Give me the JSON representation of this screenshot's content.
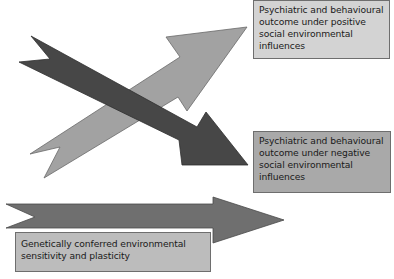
{
  "diagram": {
    "title": "",
    "colors": {
      "light_arrow": "#a0a0a0",
      "dark_arrow": "#4a4a4a",
      "bottom_arrow": "#6e6e6e",
      "box_top_fill": "#d3d3d3",
      "box_mid_fill": "#a9a9a9",
      "box_bot_fill": "#bcbcbc"
    },
    "boxes": {
      "positive_outcome": "Psychiatric and behavioural outcome under positive social environmental influences",
      "negative_outcome": "Psychiatric and behavioural outcome under negative social environmental influences",
      "genetic_sensitivity": "Genetically conferred environmental sensitivity and plasticity"
    },
    "arrows": [
      {
        "name": "positive-influence-arrow",
        "direction": "up-right",
        "shade": "light gray",
        "points_to": "positive_outcome"
      },
      {
        "name": "negative-influence-arrow",
        "direction": "down-right",
        "shade": "dark gray",
        "points_to": "negative_outcome"
      },
      {
        "name": "genetic-sensitivity-arrow",
        "direction": "right",
        "shade": "medium-dark gray",
        "label": "genetic_sensitivity"
      }
    ]
  }
}
